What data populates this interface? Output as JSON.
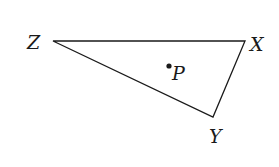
{
  "diagram": {
    "type": "triangle",
    "vertices": [
      {
        "name": "Z",
        "x": 53,
        "y": 41
      },
      {
        "name": "X",
        "x": 245,
        "y": 41
      },
      {
        "name": "Y",
        "x": 213,
        "y": 117
      }
    ],
    "point": {
      "name": "P",
      "x": 169,
      "y": 66
    },
    "labels": {
      "Z": "Z",
      "X": "X",
      "Y": "Y",
      "P": "P"
    },
    "stroke_color": "#1a1a1a"
  }
}
